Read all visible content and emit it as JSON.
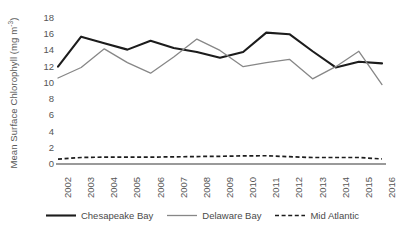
{
  "chart_data": {
    "type": "line",
    "title": "",
    "subtitle": "",
    "xlabel": "",
    "ylabel": "Mean Surface Chlorophyll (mg m⁻³)",
    "ylabel_text": "Mean Surface Chlorophyll (mg m",
    "ylabel_exponent": "-3",
    "ylabel_suffix": ")",
    "categories": [
      "2002",
      "2003",
      "2004",
      "2005",
      "2006",
      "2007",
      "2008",
      "2009",
      "2010",
      "2011",
      "2012",
      "2013",
      "2014",
      "2015",
      "2016"
    ],
    "x": [
      2002,
      2003,
      2004,
      2005,
      2006,
      2007,
      2008,
      2009,
      2010,
      2011,
      2012,
      2013,
      2014,
      2015,
      2016
    ],
    "ylim": [
      0,
      18
    ],
    "xlim": [
      2002,
      2016
    ],
    "yticks": [
      0,
      2,
      4,
      6,
      8,
      10,
      12,
      14,
      16,
      18
    ],
    "ytick_labels": [
      "0",
      "2",
      "4",
      "6",
      "8",
      "10",
      "12",
      "14",
      "16",
      "18"
    ],
    "grid": false,
    "legend_position": "bottom",
    "series": [
      {
        "name": "Chesapeake Bay",
        "color": "#1c1c1c",
        "style": "solid",
        "width": 2.1,
        "values": [
          12.0,
          15.7,
          14.9,
          14.1,
          15.2,
          14.3,
          13.8,
          13.1,
          13.8,
          16.2,
          16.0,
          13.9,
          11.9,
          12.6,
          12.4
        ]
      },
      {
        "name": "Delaware Bay",
        "color": "#878787",
        "style": "solid",
        "width": 1.3,
        "values": [
          10.6,
          11.9,
          14.2,
          12.5,
          11.2,
          13.2,
          15.4,
          14.0,
          12.0,
          12.5,
          12.9,
          10.5,
          12.0,
          13.9,
          9.8
        ]
      },
      {
        "name": "Mid Atlantic",
        "color": "#1c1c1c",
        "style": "dashed",
        "width": 1.7,
        "values": [
          0.6,
          0.8,
          0.85,
          0.85,
          0.85,
          0.88,
          0.92,
          0.95,
          1.0,
          1.02,
          0.9,
          0.8,
          0.8,
          0.8,
          0.62
        ]
      }
    ]
  },
  "legend": {
    "items": [
      {
        "label": "Chesapeake Bay",
        "swatch": "solid-thick-black-line-icon"
      },
      {
        "label": "Delaware Bay",
        "swatch": "solid-thin-gray-line-icon"
      },
      {
        "label": "Mid Atlantic",
        "swatch": "dashed-black-line-icon"
      }
    ]
  },
  "axes": {
    "x_axis_name": "year-axis",
    "y_axis_name": "chlorophyll-axis"
  }
}
